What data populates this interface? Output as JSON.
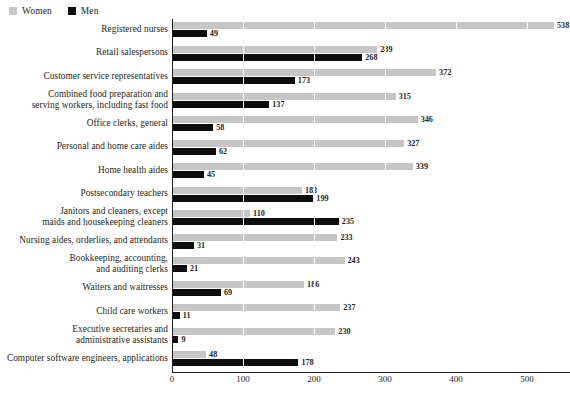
{
  "legend": {
    "items": [
      {
        "label": "Women",
        "color": "#c6c6c6",
        "icon": "square-swatch-icon"
      },
      {
        "label": "Men",
        "color": "#0d0d0d",
        "icon": "square-swatch-icon"
      }
    ]
  },
  "chart_data": {
    "type": "bar",
    "orientation": "horizontal",
    "title": "",
    "xlabel": "",
    "ylabel": "",
    "xlim": [
      0,
      560
    ],
    "xticks": [
      0,
      100,
      200,
      300,
      400,
      500
    ],
    "grid": true,
    "legend_position": "top-left",
    "categories": [
      "Registered nurses",
      "Retail salespersons",
      "Customer service representatives",
      "Combined food preparation and serving workers, including fast food",
      "Office clerks, general",
      "Personal and home care aides",
      "Home health aides",
      "Postsecondary teachers",
      "Janitors and cleaners, except maids and housekeeping cleaners",
      "Nursing aides, orderlies, and attendants",
      "Bookkeeping, accounting, and auditing clerks",
      "Waiters and waitresses",
      "Child care workers",
      "Executive secretaries and administrative assistants",
      "Computer software engineers, applications"
    ],
    "category_lines": [
      [
        "Registered nurses"
      ],
      [
        "Retail salespersons"
      ],
      [
        "Customer service representatives"
      ],
      [
        "Combined food preparation and",
        "serving workers, including fast food"
      ],
      [
        "Office clerks, general"
      ],
      [
        "Personal and home care aides"
      ],
      [
        "Home health aides"
      ],
      [
        "Postsecondary teachers"
      ],
      [
        "Janitors and cleaners, except",
        "maids and housekeeping cleaners"
      ],
      [
        "Nursing aides, orderlies, and attendants"
      ],
      [
        "Bookkeeping, accounting,",
        "and auditing clerks"
      ],
      [
        "Waiters and waitresses"
      ],
      [
        "Child care workers"
      ],
      [
        "Executive secretaries and",
        "administrative assistants"
      ],
      [
        "Computer software engineers, applications"
      ]
    ],
    "series": [
      {
        "name": "Women",
        "color": "#c6c6c6",
        "values": [
          538,
          289,
          372,
          315,
          346,
          327,
          339,
          183,
          110,
          233,
          243,
          186,
          237,
          230,
          48
        ]
      },
      {
        "name": "Men",
        "color": "#0d0d0d",
        "values": [
          49,
          268,
          173,
          137,
          58,
          62,
          45,
          199,
          235,
          31,
          21,
          69,
          11,
          9,
          178
        ]
      }
    ]
  }
}
